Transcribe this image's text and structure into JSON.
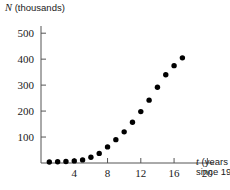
{
  "chart_data": {
    "type": "scatter",
    "title": "",
    "xlabel": "t (years since 1980)",
    "xlabel_line1": " (years",
    "xlabel_line2": "since 1980)",
    "xlabel_var": "t",
    "ylabel": "N (thousands)",
    "ylabel_var": "N",
    "ylabel_rest": " (thousands)",
    "xticks": [
      4,
      8,
      12,
      16,
      20
    ],
    "yticks": [
      100,
      200,
      300,
      400,
      500
    ],
    "xlim": [
      0,
      20.8
    ],
    "ylim": [
      0,
      520
    ],
    "grid": false,
    "legend": null,
    "marker": {
      "shape": "circle",
      "color": "#000000",
      "size_px": 5.4
    },
    "x": [
      1,
      2,
      3,
      4,
      5,
      6,
      7,
      8,
      9,
      10,
      11,
      12,
      13,
      14,
      15,
      16,
      17
    ],
    "values": [
      4,
      5,
      6,
      8,
      12,
      22,
      37,
      62,
      90,
      120,
      157,
      198,
      242,
      292,
      340,
      375,
      405
    ],
    "points": [
      {
        "t": 1,
        "N": 4
      },
      {
        "t": 2,
        "N": 5
      },
      {
        "t": 3,
        "N": 6
      },
      {
        "t": 4,
        "N": 8
      },
      {
        "t": 5,
        "N": 12
      },
      {
        "t": 6,
        "N": 22
      },
      {
        "t": 7,
        "N": 37
      },
      {
        "t": 8,
        "N": 62
      },
      {
        "t": 9,
        "N": 90
      },
      {
        "t": 10,
        "N": 120
      },
      {
        "t": 11,
        "N": 157
      },
      {
        "t": 12,
        "N": 198
      },
      {
        "t": 13,
        "N": 242
      },
      {
        "t": 14,
        "N": 292
      },
      {
        "t": 15,
        "N": 340
      },
      {
        "t": 16,
        "N": 375
      },
      {
        "t": 17,
        "N": 405
      }
    ]
  },
  "colors": {
    "axis": "#555555",
    "marker": "#000000",
    "text": "#1a1a1a",
    "background": "#ffffff"
  }
}
